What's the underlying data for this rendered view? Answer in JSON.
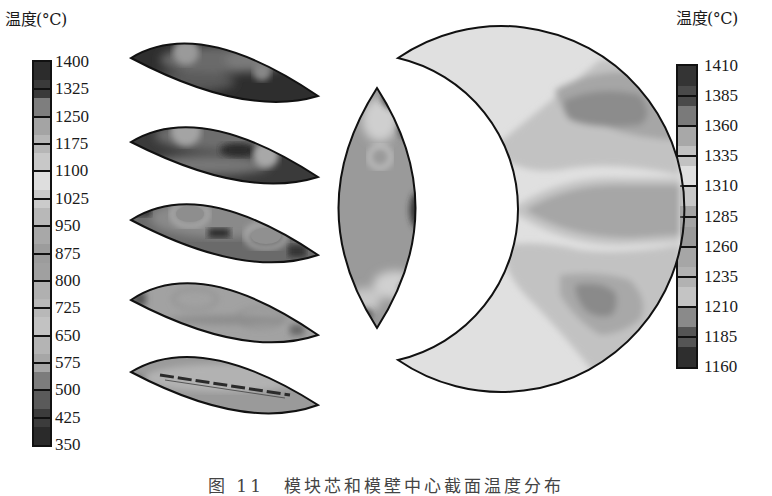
{
  "figure": {
    "caption": "图 11　模块芯和模壁中心截面温度分布",
    "left_colorbar": {
      "title": "温度(°C)",
      "labels": [
        "1400",
        "1325",
        "1250",
        "1175",
        "1100",
        "1025",
        "950",
        "875",
        "800",
        "725",
        "650",
        "575",
        "500",
        "425",
        "350"
      ],
      "segment_colors": [
        "#2c2c2c",
        "#3a3a3a",
        "#7e7e7e",
        "#a4a4a4",
        "#b6b6b6",
        "#c8c8c8",
        "#dedede",
        "#cbcbcb",
        "#b8b8b8",
        "#a8a8a8",
        "#9c9c9c",
        "#a0a0a0",
        "#b0b0b0",
        "#b8b8b8",
        "#c2c2c2",
        "#b4b4b4",
        "#a6a6a6",
        "#7c7c7c",
        "#5a5a5a",
        "#3c3c3c",
        "#2a2a2a"
      ]
    },
    "right_colorbar": {
      "title": "温度(°C)",
      "labels": [
        "1410",
        "1385",
        "1360",
        "1335",
        "1310",
        "1285",
        "1260",
        "1235",
        "1210",
        "1185",
        "1160"
      ],
      "segment_colors": [
        "#343434",
        "#4a4a4a",
        "#7a7a7a",
        "#a8a8a8",
        "#c2c2c2",
        "#e0e0e0",
        "#c8c8c8",
        "#a4a4a4",
        "#9a9a9a",
        "#a6a6a6",
        "#b2b2b2",
        "#c4c4c4",
        "#8a8a8a",
        "#555555",
        "#2e2e2e"
      ]
    },
    "panels": [
      {
        "name": "lens-1",
        "description": "top lens section, darkest"
      },
      {
        "name": "lens-2",
        "description": "second lens section"
      },
      {
        "name": "lens-3",
        "description": "third lens section with ring hot spots"
      },
      {
        "name": "lens-4",
        "description": "fourth lens section, lighter"
      },
      {
        "name": "lens-5",
        "description": "bottom lens section with dark center seam"
      },
      {
        "name": "center-lens",
        "description": "vertical lens section"
      },
      {
        "name": "crescent",
        "description": "crescent-shaped mold wall section"
      }
    ]
  }
}
